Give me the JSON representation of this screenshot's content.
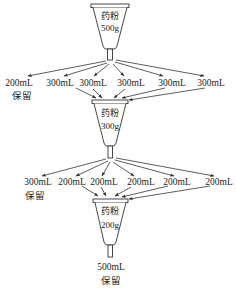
{
  "diagram": {
    "type": "process-flow",
    "stages": [
      {
        "funnel": {
          "label_top": "药粉",
          "label_bottom": "500g"
        },
        "outputs": [
          "200mL",
          "300mL",
          "300mL",
          "300mL",
          "300mL",
          "300mL"
        ],
        "kept": {
          "volume": "200mL",
          "note": "保留"
        }
      },
      {
        "funnel": {
          "label_top": "药粉",
          "label_bottom": "300g"
        },
        "outputs": [
          "300mL",
          "200mL",
          "200mL",
          "200mL",
          "200mL",
          "200mL"
        ],
        "kept": {
          "volume": "300mL",
          "note": "保留"
        }
      },
      {
        "funnel": {
          "label_top": "药粉",
          "label_bottom": "200g"
        },
        "outputs": [
          "500mL"
        ],
        "kept": {
          "volume": "500mL",
          "note": "保留"
        }
      }
    ],
    "colors": {
      "stroke": "#333333",
      "text": "#222222",
      "background": "#ffffff"
    }
  }
}
